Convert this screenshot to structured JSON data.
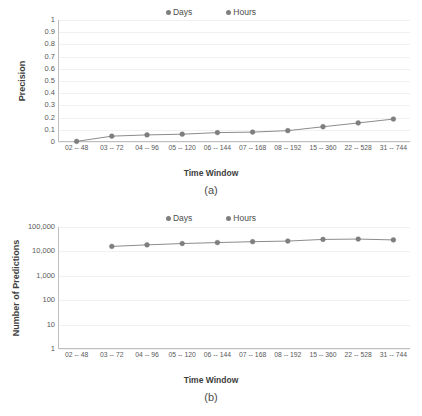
{
  "figures": [
    {
      "id": "a",
      "caption": "(a)",
      "legend": [
        {
          "label": "Days",
          "color": "#7f7f7f"
        },
        {
          "label": "Hours",
          "color": "#7f7f7f"
        }
      ],
      "chart_data": {
        "type": "line",
        "title": "",
        "xlabel": "Time Window",
        "ylabel": "Precision",
        "categories": [
          "02 -- 48",
          "03 -- 72",
          "04 -- 96",
          "05 -- 120",
          "06 -- 144",
          "07 -- 168",
          "08 -- 192",
          "15 -- 360",
          "22 -- 528",
          "31 -- 744"
        ],
        "ytick_labels": [
          "0",
          "0.1",
          "0.2",
          "0.3",
          "0.4",
          "0.5",
          "0.6",
          "0.7",
          "0.8",
          "0.9",
          "1"
        ],
        "ylim": [
          0,
          1
        ],
        "yscale": "linear",
        "grid": true,
        "legend_position": "top-center",
        "series": [
          {
            "name": "Days / Hours",
            "values": [
              0.005,
              0.048,
              0.058,
              0.064,
              0.077,
              0.081,
              0.093,
              0.125,
              0.156,
              0.188
            ]
          }
        ]
      }
    },
    {
      "id": "b",
      "caption": "(b)",
      "legend": [
        {
          "label": "Days",
          "color": "#7f7f7f"
        },
        {
          "label": "Hours",
          "color": "#7f7f7f"
        }
      ],
      "chart_data": {
        "type": "line",
        "title": "",
        "xlabel": "Time Window",
        "ylabel": "Number of Predictions",
        "categories": [
          "02 -- 48",
          "03 -- 72",
          "04 -- 96",
          "05 -- 120",
          "06 -- 144",
          "07 -- 168",
          "08 -- 192",
          "15 -- 360",
          "22 -- 528",
          "31 -- 744"
        ],
        "ytick_labels": [
          "1",
          "10",
          "100",
          "1,000",
          "10,000",
          "100,000"
        ],
        "ytick_values": [
          1,
          10,
          100,
          1000,
          10000,
          100000
        ],
        "ylim": [
          1,
          100000
        ],
        "yscale": "log",
        "grid": true,
        "legend_position": "top-center",
        "series": [
          {
            "name": "Days / Hours",
            "values": [
              null,
              16000,
              18500,
              21000,
              23000,
              25000,
              26500,
              31000,
              32000,
              29500
            ]
          }
        ]
      }
    }
  ]
}
